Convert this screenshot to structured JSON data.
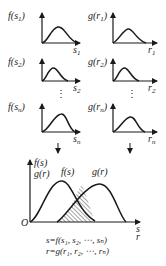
{
  "diagram": {
    "type": "stress-strength interference diagram",
    "small_plots": [
      {
        "row": 1,
        "side": "left",
        "y_label": "f(s₁)",
        "y_func": "f",
        "y_arg": "s",
        "y_sub": "1",
        "x_label": "s",
        "x_sub": "1"
      },
      {
        "row": 1,
        "side": "right",
        "y_label": "g(r₁)",
        "y_func": "g",
        "y_arg": "r",
        "y_sub": "1",
        "x_label": "r",
        "x_sub": "1"
      },
      {
        "row": 2,
        "side": "left",
        "y_label": "f(s₂)",
        "y_func": "f",
        "y_arg": "s",
        "y_sub": "2",
        "x_label": "s",
        "x_sub": "2"
      },
      {
        "row": 2,
        "side": "right",
        "y_label": "g(r₂)",
        "y_func": "g",
        "y_arg": "r",
        "y_sub": "2",
        "x_label": "r",
        "x_sub": "2"
      },
      {
        "row": "n",
        "side": "left",
        "y_label": "f(sₙ)",
        "y_func": "f",
        "y_arg": "s",
        "y_sub": "n",
        "x_label": "s",
        "x_sub": "n"
      },
      {
        "row": "n",
        "side": "right",
        "y_label": "g(rₙ)",
        "y_func": "g",
        "y_arg": "r",
        "y_sub": "n",
        "x_label": "r",
        "x_sub": "n"
      }
    ],
    "ellipsis": "⋮",
    "main_plot": {
      "y_axis_label_top": "f(s)",
      "y_axis_label_bottom": "g(r)",
      "origin_label": "O",
      "x_axis_label_top": "s",
      "x_axis_label_bottom": "r",
      "curve_1_label": "f(s)",
      "curve_2_label": "g(r)",
      "overlap_region": "hatched interference area"
    },
    "equations": {
      "line_1": "s=f(s₁, s₂, ⋯, sₙ)",
      "line_2": "r=g(r₁, r₂, ⋯, rₙ)"
    }
  }
}
